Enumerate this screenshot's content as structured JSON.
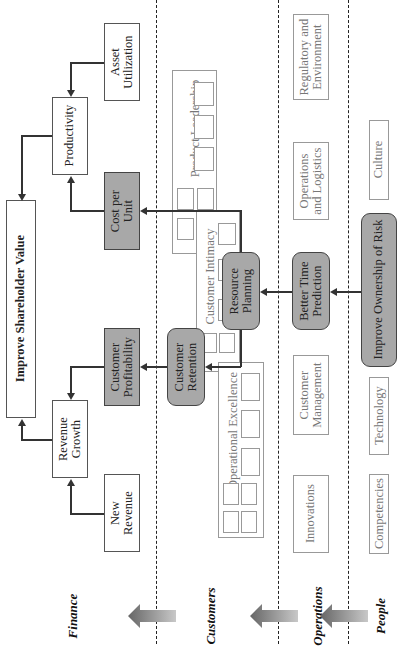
{
  "perspectives": [
    {
      "label": "Finance"
    },
    {
      "label": "Customers"
    },
    {
      "label": "Operations"
    },
    {
      "label": "People"
    }
  ],
  "finance": {
    "top": "Improve Shareholder Value",
    "productivity": "Productivity",
    "asset_utilization": [
      "Asset",
      "Utilization"
    ],
    "revenue_growth": [
      "Revenue",
      "Growth"
    ],
    "new_revenue": [
      "New",
      "Revenue"
    ],
    "cost_per_unit": [
      "Cost per",
      "Unit"
    ],
    "customer_profitability": [
      "Customer",
      "Profitability"
    ]
  },
  "customers": {
    "groups": {
      "product_leadership": "Product Leadership",
      "customer_intimacy": "Customer Intimacy",
      "operational_excellence": "Operational Excellence"
    },
    "customer_retention": [
      "Customer",
      "Retention"
    ],
    "resource_planning": [
      "Resource",
      "Planning"
    ]
  },
  "operations": {
    "regulatory": [
      "Regulatory and",
      "Environment"
    ],
    "operations_logistics": [
      "Operations",
      "and Logistics"
    ],
    "better_time_prediction": [
      "Better Time",
      "Prediction"
    ],
    "customer_management": [
      "Customer",
      "Management"
    ],
    "innovations": "Innovations"
  },
  "people": {
    "culture": "Culture",
    "improve_ownership": "Improve Ownership of Risk",
    "technology": "Technology",
    "competencies": "Competencies"
  },
  "colors": {
    "gray_fill": "#a8a8a8",
    "line": "#333333",
    "light_border": "#999999"
  }
}
